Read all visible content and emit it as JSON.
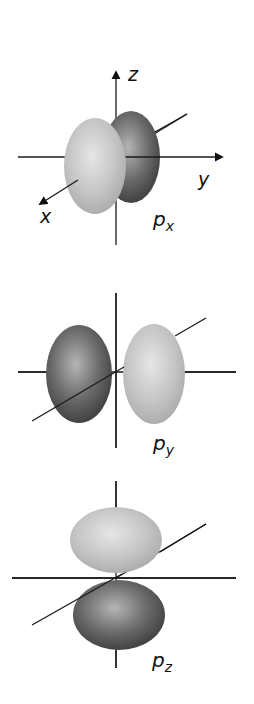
{
  "diagram": {
    "panels": [
      {
        "id": "px",
        "label_main": "p",
        "label_sub": "x",
        "axis_labels": {
          "z": "z",
          "y": "y",
          "x": "x"
        }
      },
      {
        "id": "py",
        "label_main": "p",
        "label_sub": "y"
      },
      {
        "id": "pz",
        "label_main": "p",
        "label_sub": "z"
      }
    ],
    "colors": {
      "light_lobe": "#c8c8c8",
      "dark_lobe": "#5a5a5a",
      "axis": "#1a1a1a",
      "background": "#ffffff"
    }
  }
}
